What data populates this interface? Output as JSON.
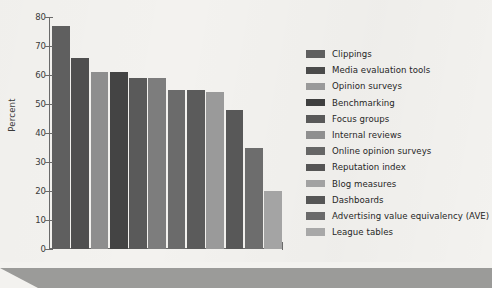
{
  "chart_data": {
    "type": "bar",
    "title": "",
    "xlabel": "",
    "ylabel": "Percent",
    "ylim": [
      0,
      80
    ],
    "yticks": [
      0,
      10,
      20,
      30,
      40,
      50,
      60,
      70,
      80
    ],
    "grid": false,
    "legend_position": "right",
    "categories": [
      "Clippings",
      "Media evaluation tools",
      "Opinion surveys",
      "Benchmarking",
      "Focus groups",
      "Internal reviews",
      "Online opinion surveys",
      "Reputation index",
      "Blog measures",
      "Dashboards",
      "Advertising value equivalency (AVE)",
      "League tables"
    ],
    "values": [
      77,
      66,
      61,
      61,
      59,
      59,
      55,
      55,
      54,
      48,
      35,
      20
    ],
    "bar_colors": [
      "#5f5f5f",
      "#4f4f4f",
      "#8e8e8e",
      "#444444",
      "#5a5a5a",
      "#7d7d7d",
      "#6b6b6b",
      "#5b5b5b",
      "#9a9a9a",
      "#585858",
      "#6d6d6d",
      "#a4a4a4"
    ]
  },
  "legend": {
    "items": [
      {
        "label": "Clippings",
        "color": "#5f5f5f"
      },
      {
        "label": "Media evaluation tools",
        "color": "#4b4b4b"
      },
      {
        "label": "Opinion surveys",
        "color": "#9a9a9a"
      },
      {
        "label": "Benchmarking",
        "color": "#3f3f3f"
      },
      {
        "label": "Focus groups",
        "color": "#595959"
      },
      {
        "label": "Internal reviews",
        "color": "#8f8f8f"
      },
      {
        "label": "Online opinion surveys",
        "color": "#666666"
      },
      {
        "label": "Reputation index",
        "color": "#555555"
      },
      {
        "label": "Blog measures",
        "color": "#a2a2a2"
      },
      {
        "label": "Dashboards",
        "color": "#565656"
      },
      {
        "label": "Advertising value equivalency (AVE)",
        "color": "#6a6a6a"
      },
      {
        "label": "League tables",
        "color": "#a8a8a8"
      }
    ]
  },
  "axis": {
    "y_label": "Percent",
    "tick_labels": [
      "80",
      "70",
      "60",
      "50",
      "40",
      "30",
      "20",
      "10",
      "0"
    ]
  },
  "colors": {
    "background": "#f3f2ef",
    "axis": "#6a6a6a",
    "text": "#262626",
    "footer_band": "#9b9b99"
  }
}
